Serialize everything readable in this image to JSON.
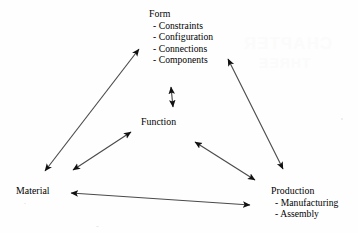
{
  "diagram": {
    "type": "relationship-triangle",
    "nodes": [
      {
        "id": "form",
        "title": "Form",
        "items": [
          "- Constraints",
          "- Configuration",
          "- Connections",
          "- Components"
        ]
      },
      {
        "id": "function",
        "title": "Function",
        "items": []
      },
      {
        "id": "material",
        "title": "Material",
        "items": []
      },
      {
        "id": "production",
        "title": "Production",
        "items": [
          "- Manufacturing",
          "- Assembly"
        ]
      }
    ],
    "edges": [
      {
        "id": "material-form",
        "from": "material",
        "to": "form",
        "style": "double-arrow"
      },
      {
        "id": "form-production",
        "from": "form",
        "to": "production",
        "style": "double-arrow"
      },
      {
        "id": "material-production",
        "from": "material",
        "to": "production",
        "style": "double-arrow"
      },
      {
        "id": "form-function",
        "from": "form",
        "to": "function",
        "style": "double-arrow"
      },
      {
        "id": "material-function",
        "from": "material",
        "to": "function",
        "style": "double-arrow"
      },
      {
        "id": "function-production",
        "from": "function",
        "to": "production",
        "style": "double-arrow"
      }
    ],
    "colors": {
      "line": "#4a4a4a",
      "arrowhead": "#111111",
      "text": "#000000",
      "background": "#fefefe",
      "watermark": "#fbfbfb"
    }
  },
  "watermark": {
    "line1": "CHAPTER",
    "line2": "THREE"
  }
}
